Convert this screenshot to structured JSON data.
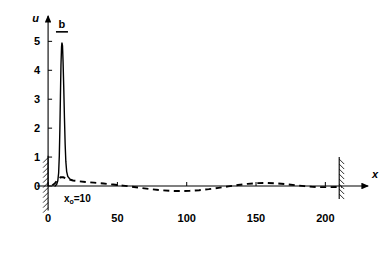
{
  "chart_data": {
    "type": "line",
    "title": "",
    "xlabel": "x",
    "ylabel": "u",
    "xlim": [
      -8,
      225
    ],
    "ylim": [
      -1.0,
      5.6
    ],
    "grid": false,
    "legend_position": "none",
    "xticks": [
      0,
      50,
      100,
      150,
      200
    ],
    "xtick_labels": [
      "0",
      "50",
      "100",
      "150",
      "200"
    ],
    "yticks": [
      0,
      1,
      2,
      3,
      4,
      5
    ],
    "ytick_labels": [
      "0",
      "1",
      "2",
      "3",
      "4",
      "5"
    ],
    "annotations": [
      {
        "name": "peak-label",
        "text": "b",
        "x": 10,
        "y": 5.45,
        "style": "overbar"
      },
      {
        "name": "source-position-label",
        "text": "x",
        "subscript": "o",
        "suffix": "=10",
        "x": 10,
        "y": -0.55
      }
    ],
    "boundaries": [
      {
        "name": "left-wall",
        "x": 0,
        "hatch_side": "left",
        "y_from": -0.85,
        "y_to": 1.05
      },
      {
        "name": "right-wall",
        "x": 210,
        "hatch_side": "right",
        "y_from": -0.45,
        "y_to": 1.0
      }
    ],
    "series": [
      {
        "name": "solid-peak-curve",
        "style": "solid",
        "color": "#000000",
        "points": [
          [
            5.0,
            0.0
          ],
          [
            6.2,
            0.06
          ],
          [
            7.0,
            0.18
          ],
          [
            7.6,
            0.45
          ],
          [
            8.1,
            1.05
          ],
          [
            8.5,
            1.95
          ],
          [
            8.9,
            3.1
          ],
          [
            9.3,
            4.2
          ],
          [
            9.7,
            4.8
          ],
          [
            10.0,
            4.96
          ],
          [
            10.4,
            4.85
          ],
          [
            10.8,
            4.3
          ],
          [
            11.3,
            3.4
          ],
          [
            11.8,
            2.35
          ],
          [
            12.3,
            1.45
          ],
          [
            12.8,
            0.85
          ],
          [
            13.4,
            0.5
          ],
          [
            14.2,
            0.33
          ],
          [
            15.5,
            0.25
          ],
          [
            17.0,
            0.21
          ]
        ]
      },
      {
        "name": "dashed-perturbation-curve",
        "style": "dashed",
        "color": "#000000",
        "points": [
          [
            3.0,
            0.02
          ],
          [
            5.0,
            0.1
          ],
          [
            7.0,
            0.22
          ],
          [
            9.0,
            0.3
          ],
          [
            11.0,
            0.3
          ],
          [
            13.0,
            0.26
          ],
          [
            15.5,
            0.22
          ],
          [
            18.0,
            0.19
          ],
          [
            22.0,
            0.165
          ],
          [
            27.0,
            0.14
          ],
          [
            33.0,
            0.115
          ],
          [
            40.0,
            0.085
          ],
          [
            47.0,
            0.05
          ],
          [
            54.0,
            0.015
          ],
          [
            60.0,
            -0.02
          ],
          [
            67.0,
            -0.065
          ],
          [
            74.0,
            -0.11
          ],
          [
            81.0,
            -0.145
          ],
          [
            88.0,
            -0.168
          ],
          [
            95.0,
            -0.175
          ],
          [
            102.0,
            -0.168
          ],
          [
            109.0,
            -0.145
          ],
          [
            116.0,
            -0.11
          ],
          [
            123.0,
            -0.065
          ],
          [
            130.0,
            -0.015
          ],
          [
            137.0,
            0.035
          ],
          [
            144.0,
            0.075
          ],
          [
            151.0,
            0.1
          ],
          [
            158.0,
            0.105
          ],
          [
            165.0,
            0.09
          ],
          [
            172.0,
            0.06
          ],
          [
            179.0,
            0.025
          ],
          [
            185.0,
            -0.005
          ],
          [
            191.0,
            -0.03
          ],
          [
            197.0,
            -0.04
          ],
          [
            203.0,
            -0.04
          ],
          [
            208.0,
            -0.035
          ],
          [
            212.0,
            -0.03
          ]
        ]
      }
    ]
  }
}
